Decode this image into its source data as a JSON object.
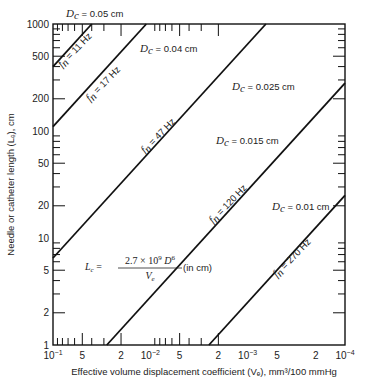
{
  "chart_data": {
    "type": "line",
    "title": "",
    "xlabel": "Effective volume displacement coefficient (Vₑ), mm³/100 mmHg",
    "ylabel": "Needle or catheter length (Lₑ), cm",
    "xscale": "log",
    "yscale": "log",
    "xlim": [
      0.1,
      0.0001
    ],
    "ylim": [
      1,
      1000
    ],
    "x_reversed": true,
    "grid": false,
    "x_major_ticks": [
      0.1,
      0.01,
      0.001,
      0.0001
    ],
    "x_tick_labels": [
      {
        "value": 0.1,
        "base": "10",
        "exp": "−1"
      },
      {
        "value": 0.05,
        "text": "5"
      },
      {
        "value": 0.02,
        "text": "2"
      },
      {
        "value": 0.01,
        "base": "10",
        "exp": "−2"
      },
      {
        "value": 0.005,
        "text": "5"
      },
      {
        "value": 0.002,
        "text": "2"
      },
      {
        "value": 0.001,
        "base": "10",
        "exp": "−3"
      },
      {
        "value": 0.0005,
        "text": "5"
      },
      {
        "value": 0.0002,
        "text": "2"
      },
      {
        "value": 0.0001,
        "base": "10",
        "exp": "−4"
      }
    ],
    "y_tick_labels": [
      {
        "value": 1000,
        "text": "1000"
      },
      {
        "value": 500,
        "text": "500"
      },
      {
        "value": 200,
        "text": "200"
      },
      {
        "value": 100,
        "text": "100"
      },
      {
        "value": 50,
        "text": "50"
      },
      {
        "value": 20,
        "text": "20"
      },
      {
        "value": 10,
        "text": "10"
      },
      {
        "value": 5,
        "text": "5"
      },
      {
        "value": 2,
        "text": "2"
      },
      {
        "value": 1,
        "text": "1"
      }
    ],
    "series": [
      {
        "name": "Dc = 0.05 cm",
        "diameter": "0.05 cm",
        "fn": "11 Hz",
        "points": [
          [
            0.1,
            400
          ],
          [
            0.04,
            1000
          ]
        ]
      },
      {
        "name": "Dc = 0.04 cm",
        "diameter": "0.04 cm",
        "fn": "17 Hz",
        "points": [
          [
            0.1,
            110
          ],
          [
            0.011,
            1000
          ]
        ]
      },
      {
        "name": "Dc = 0.025 cm",
        "diameter": "0.025 cm",
        "fn": "47 Hz",
        "points": [
          [
            0.1,
            6.5
          ],
          [
            0.00065,
            1000
          ]
        ]
      },
      {
        "name": "Dc = 0.015 cm",
        "diameter": "0.015 cm",
        "fn": "120 Hz",
        "points": [
          [
            0.028,
            1
          ],
          [
            0.0001,
            280
          ]
        ]
      },
      {
        "name": "Dc = 0.01 cm",
        "diameter": "0.01 cm",
        "fn": "270 Hz",
        "points": [
          [
            0.0025,
            1
          ],
          [
            0.0001,
            25
          ]
        ]
      }
    ],
    "annotations": {
      "diameter_prefix": "D",
      "diameter_sub": "c",
      "eq": " = ",
      "fn_prefix": "f",
      "fn_sub": "n",
      "formula_lhs": "L",
      "formula_lhs_sub": "c",
      "formula_num": "2.7 × 10",
      "formula_num_exp": "9",
      "formula_num_var": "D",
      "formula_num_var_exp": "6",
      "formula_num_var_sub": "c",
      "formula_den": "V",
      "formula_den_sub": "e",
      "formula_units": "(in cm)"
    },
    "legend": "none"
  }
}
